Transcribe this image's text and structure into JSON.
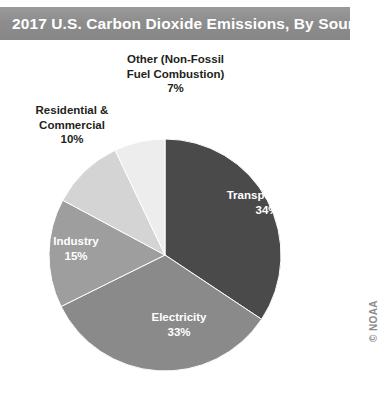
{
  "title": {
    "text": "2017 U.S. Carbon Dioxide Emissions, By Source",
    "bar_color": "#8d8d8d",
    "text_color": "#ffffff"
  },
  "credit": {
    "text": "© NOAA"
  },
  "chart_data": {
    "type": "pie",
    "title": "2017 U.S. Carbon Dioxide Emissions, By Source",
    "xlabel": "",
    "ylabel": "",
    "legend": "none",
    "grid": false,
    "start_angle_deg": 0,
    "direction": "clockwise",
    "categories": [
      "Transportation",
      "Electricity",
      "Industry",
      "Residential & Commercial",
      "Other (Non-Fossil Fuel Combustion)"
    ],
    "values": [
      34,
      33,
      15,
      10,
      7
    ],
    "units": "percent",
    "slices": [
      {
        "name": "Transportation",
        "label_line1": "Transportation",
        "label_line2": "34%",
        "value": 34,
        "color": "#4a4a4a",
        "label_color": "#ffffff",
        "label_position": "inside"
      },
      {
        "name": "Electricity",
        "label_line1": "Electricity",
        "label_line2": "33%",
        "value": 33,
        "color": "#8a8a8a",
        "label_color": "#ffffff",
        "label_position": "inside"
      },
      {
        "name": "Industry",
        "label_line1": "Industry",
        "label_line2": "15%",
        "value": 15,
        "color": "#9e9e9e",
        "label_color": "#ffffff",
        "label_position": "inside"
      },
      {
        "name": "Residential & Commercial",
        "label_line1": "Residential &",
        "label_line2": "Commercial",
        "label_line3": "10%",
        "value": 10,
        "color": "#d4d4d4",
        "label_color": "#231f20",
        "label_position": "outside"
      },
      {
        "name": "Other (Non-Fossil Fuel Combustion)",
        "label_line1": "Other (Non-Fossil",
        "label_line2": "Fuel Combustion)",
        "label_line3": "7%",
        "value": 7,
        "color": "#ededed",
        "label_color": "#231f20",
        "label_position": "outside"
      }
    ]
  }
}
